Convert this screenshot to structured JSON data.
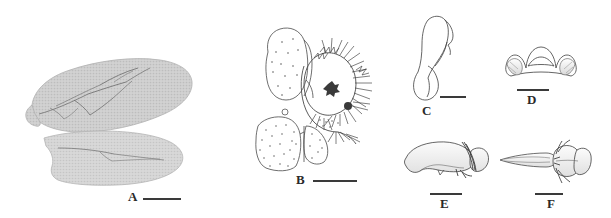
{
  "figure": {
    "type": "scientific-plate",
    "background_color": "#ffffff",
    "ink_color": "#3a3a3a",
    "label_color": "#2a2a2a",
    "panel_count": 6
  },
  "panels": [
    {
      "id": "A",
      "label": "A",
      "subject": "wings",
      "description": "Fore wing and hind wing, grayscale photograph",
      "label_x": 128,
      "label_y": 190,
      "label_size": 13,
      "scale_bar": {
        "x": 143,
        "y": 198,
        "width": 38,
        "height": 2
      }
    },
    {
      "id": "B",
      "label": "B",
      "subject": "male-terminalia",
      "description": "Male genitalia with gonocoxite, gonostylus, setae and stippled plates",
      "label_x": 296,
      "label_y": 173,
      "label_size": 13,
      "scale_bar": {
        "x": 313,
        "y": 180,
        "width": 44,
        "height": 2
      }
    },
    {
      "id": "C",
      "label": "C",
      "subject": "gonostylus",
      "description": "Elongate sclerite with bulbous base, lateral view",
      "label_x": 422,
      "label_y": 107,
      "label_size": 13,
      "scale_bar": {
        "x": 440,
        "y": 96,
        "width": 26,
        "height": 2
      }
    },
    {
      "id": "D",
      "label": "D",
      "subject": "hypandrium",
      "description": "Symmetrical dome-shaped plate with lateral lobes, ventral view",
      "label_x": 527,
      "label_y": 93,
      "label_size": 13,
      "scale_bar": {
        "x": 517,
        "y": 89,
        "width": 32,
        "height": 2
      }
    },
    {
      "id": "E",
      "label": "E",
      "subject": "aedeagus-lateral",
      "description": "Aedeagal complex, lateral view",
      "label_x": 440,
      "label_y": 197,
      "label_size": 13,
      "scale_bar": {
        "x": 430,
        "y": 193,
        "width": 32,
        "height": 2
      }
    },
    {
      "id": "F",
      "label": "F",
      "subject": "aedeagus-dorsal",
      "description": "Aedeagal complex with elongate spine and bilobed base, dorsal view",
      "label_x": 547,
      "label_y": 197,
      "label_size": 13,
      "scale_bar": {
        "x": 535,
        "y": 193,
        "width": 28,
        "height": 2
      }
    }
  ]
}
